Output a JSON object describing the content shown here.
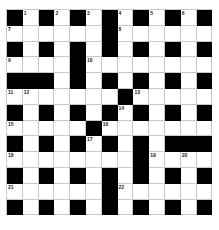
{
  "puzzle": {
    "rows": 13,
    "cols": 13,
    "colors": {
      "block": "#000000",
      "cell": "#ffffff",
      "gridline": "#c8c8c8"
    },
    "grid": [
      [
        "#",
        "1",
        "#",
        "2",
        "#",
        "3",
        "#",
        "4",
        "#",
        "5",
        "#",
        "6",
        "#"
      ],
      [
        "7",
        ".",
        ".",
        ".",
        ".",
        ".",
        "#",
        "8",
        ".",
        ".",
        ".",
        ".",
        "."
      ],
      [
        "#",
        ".",
        "#",
        ".",
        "#",
        ".",
        "#",
        ".",
        "#",
        ".",
        "#",
        ".",
        "#"
      ],
      [
        "9",
        ".",
        ".",
        ".",
        "#",
        "10",
        ".",
        ".",
        ".",
        ".",
        ".",
        ".",
        "."
      ],
      [
        "#",
        "#",
        "#",
        ".",
        "#",
        ".",
        "#",
        ".",
        "#",
        ".",
        "#",
        ".",
        "#"
      ],
      [
        "11",
        "12",
        ".",
        ".",
        ".",
        ".",
        ".",
        "#",
        "13",
        ".",
        ".",
        ".",
        "."
      ],
      [
        "#",
        ".",
        "#",
        ".",
        "#",
        ".",
        "#",
        "14",
        "#",
        ".",
        "#",
        ".",
        "#"
      ],
      [
        "15",
        ".",
        ".",
        ".",
        ".",
        "#",
        "16",
        ".",
        ".",
        ".",
        ".",
        ".",
        "."
      ],
      [
        "#",
        ".",
        "#",
        ".",
        "#",
        "17",
        "#",
        ".",
        "#",
        ".",
        "#",
        "#",
        "#"
      ],
      [
        "18",
        ".",
        ".",
        ".",
        ".",
        ".",
        ".",
        ".",
        "#",
        "19",
        ".",
        "20",
        "."
      ],
      [
        "#",
        ".",
        "#",
        ".",
        "#",
        ".",
        "#",
        ".",
        "#",
        ".",
        "#",
        ".",
        "#"
      ],
      [
        "21",
        ".",
        ".",
        ".",
        ".",
        ".",
        "#",
        "22",
        ".",
        ".",
        ".",
        ".",
        "."
      ],
      [
        "#",
        ".",
        "#",
        ".",
        "#",
        ".",
        "#",
        ".",
        "#",
        ".",
        "#",
        ".",
        "#"
      ]
    ]
  }
}
